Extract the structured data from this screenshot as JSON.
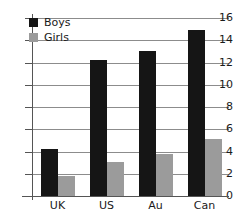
{
  "chart_data": {
    "type": "bar",
    "title": "",
    "subtitle": "",
    "xlabel": "",
    "ylabel": "",
    "categories": [
      "UK",
      "US",
      "Au",
      "Can"
    ],
    "series": [
      {
        "name": "Boys",
        "color": "#151515",
        "values": [
          4.2,
          12.2,
          13.0,
          14.9
        ]
      },
      {
        "name": "Girls",
        "color": "#9b9b9b",
        "values": [
          1.8,
          3.1,
          3.8,
          5.1
        ]
      }
    ],
    "ylim": [
      0,
      16
    ],
    "ytick_step": 2,
    "ytick_labels": [
      "0",
      "2",
      "4",
      "6",
      "8",
      "10",
      "12",
      "14",
      "16"
    ],
    "grid": true,
    "grid_axis": "y",
    "legend_position": "top-left",
    "annotations": []
  },
  "legend": {
    "items": [
      {
        "label": "Boys",
        "color": "#151515"
      },
      {
        "label": "Girls",
        "color": "#9b9b9b"
      }
    ]
  },
  "colors": {
    "boys": "#151515",
    "girls": "#9b9b9b",
    "gridline": "#8c8c8c",
    "axis": "#555555",
    "background": "#ffffff",
    "text": "#1a1a1a"
  }
}
